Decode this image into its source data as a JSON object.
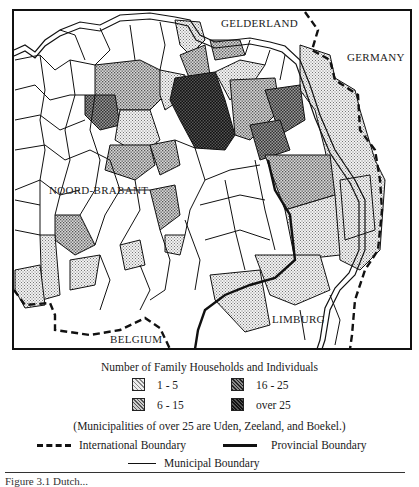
{
  "map": {
    "labels": {
      "gelderland": "GELDERLAND",
      "germany": "GERMANY",
      "noord_brabant": "NOORD-BRABANT",
      "belgium": "BELGIUM",
      "limburg": "LIMBURG"
    },
    "fill_colors": {
      "none": "#ffffff",
      "c1_5": "#d9d9d9",
      "c6_15": "#b8b8b8",
      "c16_25": "#8a8a8a",
      "over25": "#4a4a4a"
    }
  },
  "legend": {
    "title": "Number of Family Households and Individuals",
    "categories": [
      {
        "label": "1 - 5",
        "color": "#d9d9d9"
      },
      {
        "label": "6 - 15",
        "color": "#b8b8b8"
      },
      {
        "label": "16 - 25",
        "color": "#8a8a8a"
      },
      {
        "label": "over 25",
        "color": "#4a4a4a"
      }
    ],
    "note": "(Municipalities of over 25 are Uden, Zeeland, and Boekel.)",
    "boundaries": {
      "international": "International Boundary",
      "provincial": "Provincial Boundary",
      "municipal": "Municipal Boundary"
    }
  },
  "caption": "Figure 3.1 Dutch..."
}
